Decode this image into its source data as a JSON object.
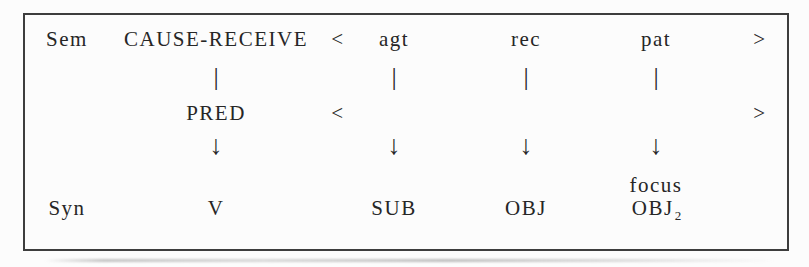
{
  "diagram": {
    "sem_label": "Sem",
    "syn_label": "Syn",
    "predicate_sem": "CAUSE-RECEIVE",
    "predicate_mid": "PRED",
    "predicate_syn": "V",
    "open_bracket": "<",
    "close_bracket": ">",
    "link_glyph": "|",
    "arrow_glyph": "↓",
    "arguments": [
      {
        "role": "agt",
        "annotation": "",
        "function": "SUB",
        "function_sub": ""
      },
      {
        "role": "rec",
        "annotation": "",
        "function": "OBJ",
        "function_sub": ""
      },
      {
        "role": "pat",
        "annotation": "focus",
        "function": "OBJ",
        "function_sub": "2"
      }
    ],
    "colors": {
      "text": "#262626",
      "border": "#3d3d3d",
      "background": "#fcfcfc"
    }
  }
}
